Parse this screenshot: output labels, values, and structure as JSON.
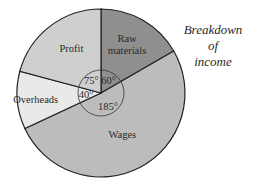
{
  "chart_data": {
    "type": "pie",
    "title": "Breakdown of income",
    "title_lines": [
      "Breakdown",
      "of",
      "income"
    ],
    "unit": "degrees",
    "start_angle_deg_from_top_clockwise": 0,
    "slices": [
      {
        "label": "Raw materials",
        "label_lines": [
          "Raw",
          "materials"
        ],
        "value": 60,
        "angle_label": "60°",
        "color": "#8f8f8f"
      },
      {
        "label": "Wages",
        "label_lines": [
          "Wages"
        ],
        "value": 185,
        "angle_label": "185°",
        "color": "#bcbcbc"
      },
      {
        "label": "Overheads",
        "label_lines": [
          "Overheads"
        ],
        "value": 40,
        "angle_label": "40°",
        "color": "#e9e9e9"
      },
      {
        "label": "Profit",
        "label_lines": [
          "Profit"
        ],
        "value": 75,
        "angle_label": "75°",
        "color": "#cfcfcf"
      }
    ],
    "total": 360,
    "legend": "none",
    "grid": false
  },
  "layout": {
    "center": [
      101,
      93
    ],
    "radius": 84,
    "inner_circle_radius": 23
  }
}
